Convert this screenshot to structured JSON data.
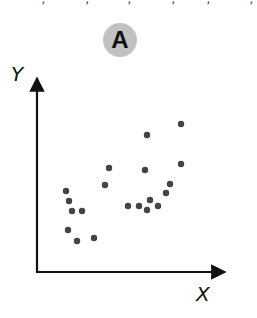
{
  "panel": {
    "label": "A",
    "badge_color": "#c2c2c2"
  },
  "top_fragments": [
    ",",
    ",",
    ",",
    ",",
    ",",
    ","
  ],
  "axes": {
    "x_label": "X",
    "y_label": "Y",
    "color": "#111111"
  },
  "chart_data": {
    "type": "scatter",
    "title": "A",
    "xlabel": "X",
    "ylabel": "Y",
    "grid": false,
    "ticks": false,
    "point_color": "#444444",
    "points": [
      {
        "x": 29,
        "y": 81
      },
      {
        "x": 32,
        "y": 71
      },
      {
        "x": 35,
        "y": 61
      },
      {
        "x": 45,
        "y": 61
      },
      {
        "x": 31,
        "y": 42
      },
      {
        "x": 40,
        "y": 31
      },
      {
        "x": 57,
        "y": 34
      },
      {
        "x": 68,
        "y": 87
      },
      {
        "x": 72,
        "y": 104
      },
      {
        "x": 91,
        "y": 66
      },
      {
        "x": 102,
        "y": 66
      },
      {
        "x": 113,
        "y": 72
      },
      {
        "x": 110,
        "y": 62
      },
      {
        "x": 121,
        "y": 66
      },
      {
        "x": 129,
        "y": 79
      },
      {
        "x": 133,
        "y": 88
      },
      {
        "x": 108,
        "y": 102
      },
      {
        "x": 110,
        "y": 137
      },
      {
        "x": 144,
        "y": 148
      },
      {
        "x": 144,
        "y": 108
      }
    ]
  }
}
